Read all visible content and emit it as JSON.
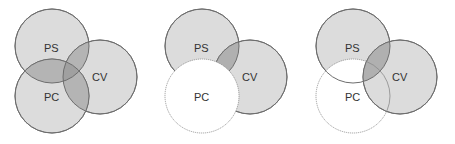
{
  "colors": {
    "fill": "#dcdcdc",
    "fill_dark": "#b4b4b4",
    "fill_darker": "#a0a0a0",
    "stroke": "#6e6e6e",
    "white": "#ffffff",
    "text": "#333333"
  },
  "diagrams": [
    {
      "id": "all-overlapping",
      "labels": {
        "ps": "PS",
        "cv": "CV",
        "pc": "PC"
      }
    },
    {
      "id": "pc-excluded",
      "labels": {
        "ps": "PS",
        "cv": "CV",
        "pc": "PC"
      }
    },
    {
      "id": "pc-excluded-cv-overlap",
      "labels": {
        "ps": "PS",
        "cv": "CV",
        "pc": "PC"
      }
    }
  ]
}
